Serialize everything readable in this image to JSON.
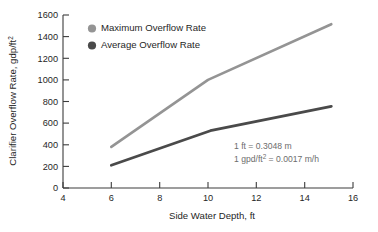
{
  "chart_data": {
    "type": "line",
    "title": "",
    "xlabel": "Side Water Depth, ft",
    "ylabel": "Clarifier Overflow Rate, gdp/ft²",
    "xlim": [
      4,
      16
    ],
    "ylim": [
      0,
      1600
    ],
    "xticks": [
      4,
      6,
      8,
      10,
      12,
      14,
      16
    ],
    "yticks": [
      0,
      200,
      400,
      600,
      800,
      1000,
      1200,
      1400,
      1600
    ],
    "grid": false,
    "legend_position": "upper-left-inside",
    "series": [
      {
        "name": "Maximum Overflow Rate",
        "color": "#949494",
        "x": [
          6.0,
          10.0,
          15.1
        ],
        "values": [
          380,
          1000,
          1515
        ]
      },
      {
        "name": "Average Overflow Rate",
        "color": "#4a4a4a",
        "x": [
          6.0,
          10.1,
          15.1
        ],
        "values": [
          210,
          530,
          755
        ]
      }
    ],
    "annotations": [
      "1 ft = 0.3048 m",
      "1 gpd/ft² = 0.0017 m/h"
    ]
  },
  "axis": {
    "x_title": "Side Water Depth, ft",
    "y_title_main": "Clarifier Overflow Rate, gdp/ft",
    "y_title_sup": "2",
    "x_tick_labels": [
      "4",
      "6",
      "8",
      "10",
      "12",
      "14",
      "16"
    ],
    "y_tick_labels": [
      "0",
      "200",
      "400",
      "600",
      "800",
      "1000",
      "1200",
      "1400",
      "1600"
    ]
  },
  "legend": {
    "items": [
      {
        "label": "Maximum Overflow Rate",
        "color": "#949494"
      },
      {
        "label": "Average Overflow Rate",
        "color": "#4a4a4a"
      }
    ]
  },
  "notes": {
    "line1": "1 ft = 0.3048 m",
    "line2_pre": "1 gpd/ft",
    "line2_sup": "2",
    "line2_post": " = 0.0017 m/h"
  }
}
